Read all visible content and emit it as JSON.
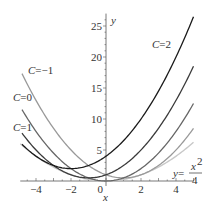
{
  "chart_data": {
    "type": "line",
    "title": "",
    "xlabel": "x",
    "ylabel": "y",
    "xlim": [
      -4.9,
      5
    ],
    "ylim": [
      -0.8,
      27
    ],
    "grid": false,
    "x_ticks": [
      -4,
      -2,
      0,
      2,
      4
    ],
    "x_tick_labels": [
      "-4",
      "-2",
      "0",
      "2",
      "4"
    ],
    "y_ticks": [
      5,
      10,
      15,
      20,
      25
    ],
    "y_tick_labels": [
      "5",
      "10",
      "15",
      "20",
      "25"
    ],
    "series": [
      {
        "name": "C=2",
        "label_var": "C",
        "label_eq": "=2",
        "C": 2,
        "formula": "y = x^2/2 + C x + C^2",
        "x_range": [
          -4.8,
          5
        ],
        "color": "#1a1a1a"
      },
      {
        "name": "C=1",
        "label_var": "C",
        "label_eq": "=1",
        "C": 1,
        "formula": "y = x^2/2 + C x + C^2",
        "x_range": [
          -4.8,
          5
        ],
        "color": "#3a3a3a"
      },
      {
        "name": "C=0",
        "label_var": "C",
        "label_eq": "=0",
        "C": 0,
        "formula": "y = x^2/2 + C x + C^2",
        "x_range": [
          -4.8,
          5
        ],
        "color": "#666666"
      },
      {
        "name": "C=-1",
        "label_var": "C",
        "label_eq": "=−1",
        "C": -1,
        "formula": "y = x^2/2 + C x + C^2",
        "x_range": [
          -4.8,
          5
        ],
        "color": "#999999"
      },
      {
        "name": "y=x^2/4",
        "envelope": true,
        "formula": "y = x^2/4",
        "x_range": [
          -4.9,
          5
        ],
        "color": "#c8c8c8"
      }
    ],
    "annotations": {
      "envelope_label_lhs": "y=",
      "envelope_label_num": "x",
      "envelope_label_exp": "2",
      "envelope_label_den": "4"
    }
  }
}
